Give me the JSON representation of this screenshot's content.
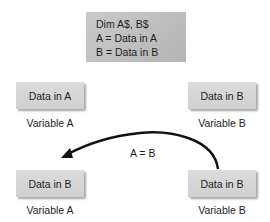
{
  "code_block": {
    "lines": [
      "Dim A$, B$",
      "A = Data in A",
      "B = Data in B"
    ]
  },
  "before": {
    "variable_a": {
      "content": "Data in A",
      "label": "Variable A"
    },
    "variable_b": {
      "content": "Data in B",
      "label": "Variable B"
    }
  },
  "after": {
    "variable_a": {
      "content": "Data in B",
      "label": "Variable A"
    },
    "variable_b": {
      "content": "Data in B",
      "label": "Variable B"
    }
  },
  "assignment": {
    "label": "A = B",
    "direction": "from Variable B to Variable A"
  },
  "colors": {
    "code_box": "#c2c2c2",
    "var_box": "#d6d6d6",
    "text": "#1e1e1e",
    "arrow": "#111111"
  }
}
